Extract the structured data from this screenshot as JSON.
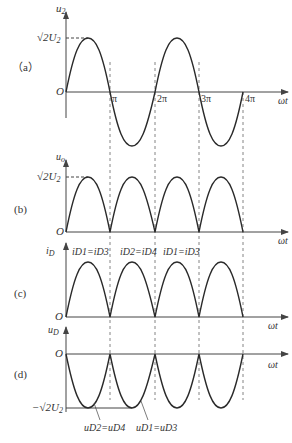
{
  "panels": [
    {
      "id": "a",
      "label": "（a）",
      "ylabel": "u",
      "ylabel_sub": "2",
      "peak_label": "√2U",
      "peak_label_sub": "2",
      "origin": "O",
      "xlabel": "ωt",
      "ticks": [
        "π",
        "2π",
        "3π",
        "4π"
      ]
    },
    {
      "id": "b",
      "label": "(b)",
      "ylabel": "u",
      "ylabel_sub": "o",
      "peak_label": "√2U",
      "peak_label_sub": "2",
      "origin": "O",
      "xlabel": "ωt"
    },
    {
      "id": "c",
      "label": "(c)",
      "ylabel": "i",
      "ylabel_sub": "D",
      "origin": "O",
      "xlabel": "ωt",
      "annotations": [
        "iD1=iD3",
        "iD2=iD4",
        "iD1=iD3"
      ]
    },
    {
      "id": "d",
      "label": "(d)",
      "ylabel": "u",
      "ylabel_sub": "D",
      "trough_label": "−√2U",
      "trough_label_sub": "2",
      "origin": "O",
      "xlabel": "ωt",
      "annotations": [
        "uD2=uD4",
        "uD1=uD3"
      ]
    }
  ],
  "colors": {
    "curve": "#2a2a2a",
    "axis": "#444444",
    "dash": "#555555"
  }
}
